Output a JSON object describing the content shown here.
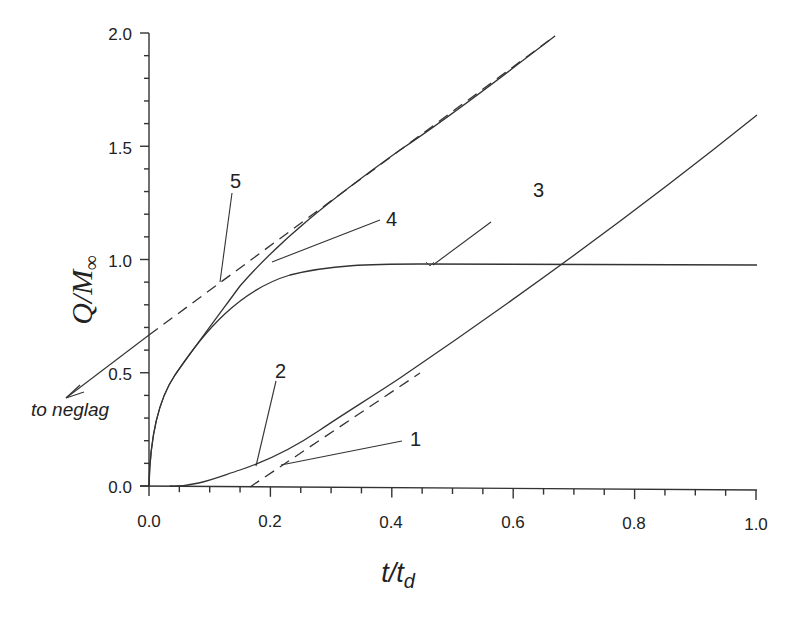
{
  "chart_data": {
    "type": "line",
    "title": "",
    "xlabel": "t/t_d",
    "ylabel": "Q/M_∞",
    "xlim": [
      0.0,
      1.0
    ],
    "ylim": [
      0.0,
      2.0
    ],
    "grid": false,
    "legend": "none (curves labelled by numbers 1–5 with leader lines)",
    "x_ticks": [
      "0.0",
      "0.2",
      "0.4",
      "0.6",
      "0.8",
      "1.0"
    ],
    "y_ticks": [
      "0.0",
      "0.5",
      "1.0",
      "1.5",
      "2.0"
    ],
    "series": [
      {
        "name": "1",
        "style": "dashed",
        "description": "time-lag asymptote, Q/M∞ = 2(t/td − 1/6)",
        "x": [
          0.167,
          0.4,
          0.6,
          1.0
        ],
        "y": [
          0.0,
          0.47,
          0.87,
          1.67
        ]
      },
      {
        "name": "2",
        "style": "solid",
        "description": "permeation (lag) curve approaching line 1",
        "x": [
          0.0,
          0.05,
          0.1,
          0.15,
          0.2,
          0.3,
          0.4,
          0.5,
          0.6,
          0.8,
          1.0
        ],
        "y": [
          0.0,
          0.0,
          0.02,
          0.07,
          0.14,
          0.3,
          0.47,
          0.67,
          0.87,
          1.27,
          1.64
        ]
      },
      {
        "name": "3",
        "style": "solid",
        "description": "sorption curve saturating at ~0.98",
        "x": [
          0.0,
          0.02,
          0.05,
          0.1,
          0.15,
          0.2,
          0.3,
          0.4,
          0.5,
          0.6,
          0.8,
          1.0
        ],
        "y": [
          0.0,
          0.3,
          0.47,
          0.66,
          0.79,
          0.87,
          0.95,
          0.975,
          0.98,
          0.98,
          0.98,
          0.98
        ]
      },
      {
        "name": "4",
        "style": "solid",
        "description": "desorption/neglag curve approaching line 5",
        "x": [
          0.0,
          0.02,
          0.05,
          0.1,
          0.15,
          0.2,
          0.3,
          0.4,
          0.5,
          0.67
        ],
        "y": [
          0.0,
          0.3,
          0.47,
          0.66,
          0.83,
          0.97,
          1.22,
          1.45,
          1.66,
          2.0
        ]
      },
      {
        "name": "5",
        "style": "dashed",
        "description": "neglag asymptote, Q/M∞ = 2 t/td + 2/3",
        "x": [
          0.0,
          0.2,
          0.4,
          0.669
        ],
        "y": [
          0.667,
          1.067,
          1.467,
          2.0
        ]
      }
    ],
    "annotations": [
      {
        "text": "1",
        "points_to": [
          0.22,
          0.09
        ]
      },
      {
        "text": "2",
        "points_to": [
          0.18,
          0.09
        ]
      },
      {
        "text": "3",
        "points_to": [
          0.46,
          0.98
        ]
      },
      {
        "text": "4",
        "points_to": [
          0.21,
          0.99
        ]
      },
      {
        "text": "5",
        "points_to": [
          0.12,
          0.9
        ]
      },
      {
        "text": "to neglag",
        "arrow_from": [
          0.0,
          0.667
        ],
        "arrow_to": [
          -0.19,
          0.42
        ]
      }
    ]
  },
  "labels": {
    "xlabel_main": "t/t",
    "xlabel_sub": "d",
    "ylabel_main": "Q/M",
    "ylabel_sub": "∞",
    "to_neglag": "to neglag",
    "x_ticks": [
      "0.0",
      "0.2",
      "0.4",
      "0.6",
      "0.8",
      "1.0"
    ],
    "y_ticks": [
      "0.0",
      "0.5",
      "1.0",
      "1.5",
      "2.0"
    ],
    "curve_labels": [
      "1",
      "2",
      "3",
      "4",
      "5"
    ]
  }
}
